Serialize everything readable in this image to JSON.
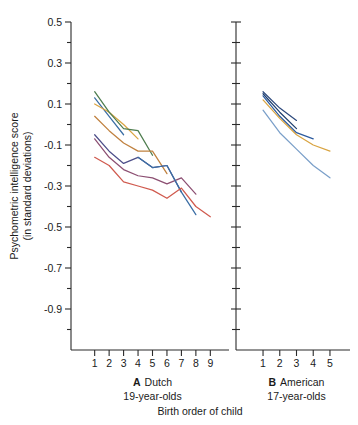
{
  "figure": {
    "xlabel": "Birth order of child",
    "ylabel_line1": "Psychometric intelligence score",
    "ylabel_line2": "(in standard deviations)"
  },
  "chart_data": {
    "type": "line",
    "title": "",
    "xlabel": "Birth order of child",
    "ylabel": "Psychometric intelligence score (in standard deviations)",
    "ylim": [
      -1.1,
      0.5
    ],
    "ytick_labels": [
      "0.5",
      "0.3",
      "0.1",
      "-0.1",
      "-0.3",
      "-0.5",
      "-0.7",
      "-0.9"
    ],
    "ytick_values": [
      0.5,
      0.3,
      0.1,
      -0.1,
      -0.3,
      -0.5,
      -0.7,
      -0.9
    ],
    "yminor_values": [
      0.4,
      0.2,
      0.0,
      -0.2,
      -0.4,
      -0.6,
      -0.8,
      -1.0
    ],
    "grid": false,
    "legend": "none",
    "panels": [
      {
        "id": "A",
        "letter": "A",
        "name": "Dutch",
        "subtitle": "19-year-olds",
        "xlim": [
          0.4,
          9.6
        ],
        "xtick_labels": [
          "1",
          "2",
          "3",
          "4",
          "5",
          "6",
          "7",
          "8",
          "9"
        ],
        "xtick_values": [
          1,
          2,
          3,
          4,
          5,
          6,
          7,
          8,
          9
        ],
        "series": [
          {
            "name": "family-size-2",
            "color": "#3b6ea5",
            "x": [
              1,
              2,
              3
            ],
            "values": [
              0.13,
              0.04,
              -0.05
            ]
          },
          {
            "name": "family-size-3",
            "color": "#d9a441",
            "x": [
              1,
              2,
              3,
              4
            ],
            "values": [
              0.1,
              0.06,
              0.0,
              -0.07
            ]
          },
          {
            "name": "family-size-4",
            "color": "#4e7d4e",
            "x": [
              1,
              2,
              3,
              4,
              5
            ],
            "values": [
              0.16,
              0.06,
              -0.02,
              -0.03,
              -0.15
            ]
          },
          {
            "name": "family-size-5",
            "color": "#c0813f",
            "x": [
              1,
              2,
              3,
              4,
              5,
              6
            ],
            "values": [
              0.04,
              -0.03,
              -0.09,
              -0.13,
              -0.13,
              -0.24
            ]
          },
          {
            "name": "family-size-6",
            "color": "#4d4f8a",
            "x": [
              1,
              2,
              3,
              4,
              5,
              6,
              7
            ],
            "values": [
              -0.05,
              -0.13,
              -0.19,
              -0.16,
              -0.21,
              -0.2,
              -0.33
            ]
          },
          {
            "name": "family-size-7",
            "color": "#8c4f72",
            "x": [
              1,
              2,
              3,
              4,
              5,
              6,
              7,
              8
            ],
            "values": [
              -0.07,
              -0.16,
              -0.22,
              -0.25,
              -0.26,
              -0.29,
              -0.26,
              -0.34
            ]
          },
          {
            "name": "family-size-8",
            "color": "#3b6ea5",
            "x": [
              4,
              5,
              6,
              7,
              8
            ],
            "values": [
              -0.16,
              -0.21,
              -0.2,
              -0.33,
              -0.44
            ]
          },
          {
            "name": "family-size-9",
            "color": "#d05a4e",
            "x": [
              1,
              2,
              3,
              4,
              5,
              6,
              7,
              8,
              9
            ],
            "values": [
              -0.16,
              -0.2,
              -0.28,
              -0.3,
              -0.32,
              -0.36,
              -0.31,
              -0.4,
              -0.45
            ]
          }
        ]
      },
      {
        "id": "B",
        "letter": "B",
        "name": "American",
        "subtitle": "17-year-olds",
        "xlim": [
          0.4,
          5.6
        ],
        "xtick_labels": [
          "1",
          "2",
          "3",
          "4",
          "5"
        ],
        "xtick_values": [
          1,
          2,
          3,
          4,
          5
        ],
        "series": [
          {
            "name": "family-size-2",
            "color": "#2e4a7d",
            "x": [
              1,
              2,
              3
            ],
            "values": [
              0.16,
              0.08,
              0.02
            ]
          },
          {
            "name": "family-size-3",
            "color": "#1f3f6e",
            "x": [
              1,
              2,
              3
            ],
            "values": [
              0.15,
              0.06,
              -0.02
            ]
          },
          {
            "name": "family-size-4",
            "color": "#2b5a9e",
            "x": [
              1,
              2,
              3,
              4
            ],
            "values": [
              0.14,
              0.04,
              -0.04,
              -0.07
            ]
          },
          {
            "name": "family-size-5",
            "color": "#d9a441",
            "x": [
              1,
              2,
              3,
              4,
              5
            ],
            "values": [
              0.12,
              0.03,
              -0.05,
              -0.1,
              -0.13
            ]
          },
          {
            "name": "family-size-6",
            "color": "#7a9fc9",
            "x": [
              1,
              2,
              3,
              4,
              5
            ],
            "values": [
              0.07,
              -0.04,
              -0.12,
              -0.2,
              -0.26
            ]
          }
        ]
      }
    ]
  }
}
